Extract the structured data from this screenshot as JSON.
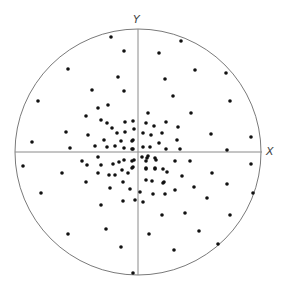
{
  "diagram": {
    "type": "scatter-in-circle",
    "circle": {
      "cx": 138,
      "cy": 152,
      "r": 123,
      "stroke": "#7a7a7a"
    },
    "axes": {
      "x": {
        "label": "X",
        "y": 152,
        "x1": 15,
        "x2": 262,
        "label_x": 266,
        "label_y": 146
      },
      "y": {
        "label": "Y",
        "x": 138,
        "y1": 29,
        "y2": 275,
        "label_x": 133,
        "label_y": 14
      },
      "stroke": "#8a8a8a"
    },
    "dot_color": "#111111",
    "dot_radius": 1.8,
    "points": [
      [
        111,
        37
      ],
      [
        124,
        51
      ],
      [
        68,
        69
      ],
      [
        118,
        77
      ],
      [
        92,
        90
      ],
      [
        124,
        91
      ],
      [
        38,
        101
      ],
      [
        108,
        105
      ],
      [
        98,
        108
      ],
      [
        86,
        116
      ],
      [
        101,
        120
      ],
      [
        107,
        123
      ],
      [
        125,
        122
      ],
      [
        133,
        121
      ],
      [
        112,
        128
      ],
      [
        117,
        133
      ],
      [
        125,
        132
      ],
      [
        134,
        129
      ],
      [
        143,
        133
      ],
      [
        66,
        132
      ],
      [
        88,
        135
      ],
      [
        32,
        142
      ],
      [
        104,
        140
      ],
      [
        121,
        141
      ],
      [
        133,
        140
      ],
      [
        181,
        41
      ],
      [
        159,
        53
      ],
      [
        195,
        70
      ],
      [
        226,
        73
      ],
      [
        165,
        79
      ],
      [
        173,
        96
      ],
      [
        230,
        101
      ],
      [
        148,
        113
      ],
      [
        191,
        113
      ],
      [
        146,
        123
      ],
      [
        154,
        126
      ],
      [
        166,
        122
      ],
      [
        178,
        127
      ],
      [
        211,
        134
      ],
      [
        162,
        133
      ],
      [
        151,
        135
      ],
      [
        251,
        137
      ],
      [
        177,
        140
      ],
      [
        159,
        143
      ],
      [
        70,
        148
      ],
      [
        95,
        146
      ],
      [
        107,
        147
      ],
      [
        115,
        146
      ],
      [
        124,
        148
      ],
      [
        133,
        149
      ],
      [
        23,
        166
      ],
      [
        82,
        161
      ],
      [
        87,
        165
      ],
      [
        98,
        157
      ],
      [
        101,
        165
      ],
      [
        113,
        164
      ],
      [
        119,
        162
      ],
      [
        124,
        160
      ],
      [
        134,
        160
      ],
      [
        122,
        170
      ],
      [
        133,
        167
      ],
      [
        62,
        173
      ],
      [
        98,
        173
      ],
      [
        109,
        175
      ],
      [
        115,
        175
      ],
      [
        128,
        173
      ],
      [
        86,
        182
      ],
      [
        123,
        182
      ],
      [
        110,
        188
      ],
      [
        130,
        189
      ],
      [
        41,
        193
      ],
      [
        101,
        205
      ],
      [
        123,
        201
      ],
      [
        135,
        200
      ],
      [
        106,
        229
      ],
      [
        68,
        234
      ],
      [
        121,
        247
      ],
      [
        133,
        273
      ],
      [
        166,
        149
      ],
      [
        180,
        149
      ],
      [
        227,
        150
      ],
      [
        147,
        158
      ],
      [
        155,
        158
      ],
      [
        175,
        161
      ],
      [
        190,
        161
      ],
      [
        251,
        164
      ],
      [
        146,
        168
      ],
      [
        155,
        169
      ],
      [
        167,
        172
      ],
      [
        212,
        173
      ],
      [
        182,
        176
      ],
      [
        146,
        180
      ],
      [
        152,
        181
      ],
      [
        164,
        182
      ],
      [
        227,
        184
      ],
      [
        194,
        187
      ],
      [
        175,
        190
      ],
      [
        153,
        194
      ],
      [
        165,
        194
      ],
      [
        253,
        193
      ],
      [
        207,
        198
      ],
      [
        162,
        215
      ],
      [
        185,
        213
      ],
      [
        230,
        215
      ],
      [
        149,
        234
      ],
      [
        199,
        231
      ],
      [
        218,
        244
      ],
      [
        174,
        250
      ],
      [
        143,
        147
      ],
      [
        150,
        147
      ],
      [
        132,
        141
      ],
      [
        132,
        149
      ],
      [
        142,
        157
      ],
      [
        148,
        156
      ],
      [
        146,
        161
      ],
      [
        156,
        160
      ],
      [
        132,
        161
      ],
      [
        132,
        168
      ],
      [
        146,
        169
      ],
      [
        155,
        168
      ],
      [
        163,
        169
      ],
      [
        163,
        183
      ],
      [
        140,
        192
      ],
      [
        143,
        202
      ]
    ]
  }
}
